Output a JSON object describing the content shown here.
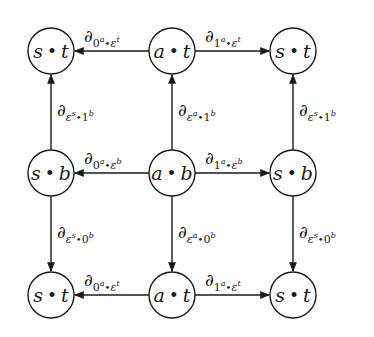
{
  "diagram": {
    "type": "commutative-diagram",
    "stroke_color": "#1a1a1a",
    "nodes": [
      {
        "id": "tl",
        "left": "s",
        "dot": "•",
        "right": "t",
        "x": 51,
        "y": 51
      },
      {
        "id": "tm",
        "left": "a",
        "dot": "•",
        "right": "t",
        "x": 172,
        "y": 51
      },
      {
        "id": "tr",
        "left": "s",
        "dot": "•",
        "right": "t",
        "x": 293,
        "y": 51
      },
      {
        "id": "ml",
        "left": "s",
        "dot": "•",
        "right": "b",
        "x": 51,
        "y": 173
      },
      {
        "id": "mm",
        "left": "a",
        "dot": "•",
        "right": "b",
        "x": 172,
        "y": 173
      },
      {
        "id": "mr",
        "left": "s",
        "dot": "•",
        "right": "b",
        "x": 293,
        "y": 173
      },
      {
        "id": "bl",
        "left": "s",
        "dot": "•",
        "right": "t",
        "x": 51,
        "y": 295
      },
      {
        "id": "bm",
        "left": "a",
        "dot": "•",
        "right": "t",
        "x": 172,
        "y": 295
      },
      {
        "id": "br",
        "left": "s",
        "dot": "•",
        "right": "t",
        "x": 293,
        "y": 295
      }
    ],
    "edges": [
      {
        "from": "tm",
        "to": "tl",
        "label": {
          "d": "∂",
          "s1": "0",
          "e1": "a",
          "s2": "ε",
          "e2": "t"
        }
      },
      {
        "from": "tm",
        "to": "tr",
        "label": {
          "d": "∂",
          "s1": "1",
          "e1": "a",
          "s2": "ε",
          "e2": "t"
        }
      },
      {
        "from": "mm",
        "to": "ml",
        "label": {
          "d": "∂",
          "s1": "0",
          "e1": "a",
          "s2": "ε",
          "e2": "b"
        }
      },
      {
        "from": "mm",
        "to": "mr",
        "label": {
          "d": "∂",
          "s1": "1",
          "e1": "a",
          "s2": "ε",
          "e2": "b"
        }
      },
      {
        "from": "bm",
        "to": "bl",
        "label": {
          "d": "∂",
          "s1": "0",
          "e1": "a",
          "s2": "ε",
          "e2": "t"
        }
      },
      {
        "from": "bm",
        "to": "br",
        "label": {
          "d": "∂",
          "s1": "1",
          "e1": "a",
          "s2": "ε",
          "e2": "t"
        }
      },
      {
        "from": "ml",
        "to": "tl",
        "label": {
          "d": "∂",
          "s1": "ε",
          "e1": "s",
          "s2": "1",
          "e2": "b"
        }
      },
      {
        "from": "mm",
        "to": "tm",
        "label": {
          "d": "∂",
          "s1": "ε",
          "e1": "a",
          "s2": "1",
          "e2": "b"
        }
      },
      {
        "from": "mr",
        "to": "tr",
        "label": {
          "d": "∂",
          "s1": "ε",
          "e1": "s",
          "s2": "1",
          "e2": "b"
        }
      },
      {
        "from": "ml",
        "to": "bl",
        "label": {
          "d": "∂",
          "s1": "ε",
          "e1": "s",
          "s2": "0",
          "e2": "b"
        }
      },
      {
        "from": "mm",
        "to": "bm",
        "label": {
          "d": "∂",
          "s1": "ε",
          "e1": "a",
          "s2": "0",
          "e2": "b"
        }
      },
      {
        "from": "mr",
        "to": "br",
        "label": {
          "d": "∂",
          "s1": "ε",
          "e1": "s",
          "s2": "0",
          "e2": "b"
        }
      }
    ]
  },
  "labels": {
    "h_top_left": {
      "d": "∂",
      "s1": "0",
      "e1": "a",
      "dot": "•",
      "s2": "ε",
      "e2": "t"
    },
    "h_top_right": {
      "d": "∂",
      "s1": "1",
      "e1": "a",
      "dot": "•",
      "s2": "ε",
      "e2": "t"
    },
    "h_mid_left": {
      "d": "∂",
      "s1": "0",
      "e1": "a",
      "dot": "•",
      "s2": "ε",
      "e2": "b"
    },
    "h_mid_right": {
      "d": "∂",
      "s1": "1",
      "e1": "a",
      "dot": "•",
      "s2": "ε",
      "e2": "b"
    },
    "h_bot_left": {
      "d": "∂",
      "s1": "0",
      "e1": "a",
      "dot": "•",
      "s2": "ε",
      "e2": "t"
    },
    "h_bot_right": {
      "d": "∂",
      "s1": "1",
      "e1": "a",
      "dot": "•",
      "s2": "ε",
      "e2": "t"
    },
    "v_up_left": {
      "d": "∂",
      "s1": "ε",
      "e1": "s",
      "dot": "•",
      "s2": "1",
      "e2": "b"
    },
    "v_up_mid": {
      "d": "∂",
      "s1": "ε",
      "e1": "a",
      "dot": "•",
      "s2": "1",
      "e2": "b"
    },
    "v_up_right": {
      "d": "∂",
      "s1": "ε",
      "e1": "s",
      "dot": "•",
      "s2": "1",
      "e2": "b"
    },
    "v_down_left": {
      "d": "∂",
      "s1": "ε",
      "e1": "s",
      "dot": "•",
      "s2": "0",
      "e2": "b"
    },
    "v_down_mid": {
      "d": "∂",
      "s1": "ε",
      "e1": "a",
      "dot": "•",
      "s2": "0",
      "e2": "b"
    },
    "v_down_right": {
      "d": "∂",
      "s1": "ε",
      "e1": "s",
      "dot": "•",
      "s2": "0",
      "e2": "b"
    }
  },
  "nodes": {
    "tl": {
      "l": "s",
      "dot": "•",
      "r": "t"
    },
    "tm": {
      "l": "a",
      "dot": "•",
      "r": "t"
    },
    "tr": {
      "l": "s",
      "dot": "•",
      "r": "t"
    },
    "ml": {
      "l": "s",
      "dot": "•",
      "r": "b"
    },
    "mm": {
      "l": "a",
      "dot": "•",
      "r": "b"
    },
    "mr": {
      "l": "s",
      "dot": "•",
      "r": "b"
    },
    "bl": {
      "l": "s",
      "dot": "•",
      "r": "t"
    },
    "bm": {
      "l": "a",
      "dot": "•",
      "r": "t"
    },
    "br": {
      "l": "s",
      "dot": "•",
      "r": "t"
    }
  }
}
